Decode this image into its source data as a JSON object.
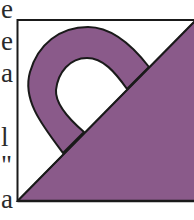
{
  "text_fragments": [
    {
      "text": "e",
      "top": -4
    },
    {
      "text": "e",
      "top": 28
    },
    {
      "text": "a",
      "top": 60
    },
    {
      "text": "",
      "top": 92
    },
    {
      "text": "l",
      "top": 124
    },
    {
      "text": "\"",
      "top": 152
    },
    {
      "text": "a",
      "top": 186
    }
  ],
  "figure": {
    "colors": {
      "fill": "#8a5a8a",
      "outline": "#1a1a1a",
      "background": "#ffffff"
    }
  }
}
